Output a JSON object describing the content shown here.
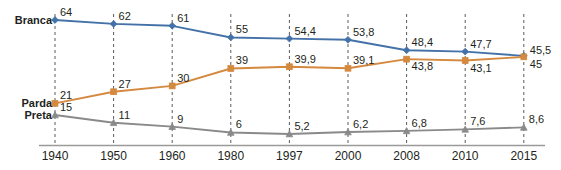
{
  "chart_data": {
    "type": "line",
    "title": "",
    "subtitle": "",
    "xlabel": "",
    "ylabel": "",
    "grid": "vertical-dashed",
    "legend_position": "inline-left",
    "categories": [
      "1940",
      "1950",
      "1960",
      "1980",
      "1997",
      "2000",
      "2008",
      "2010",
      "2015"
    ],
    "xlim": [
      0,
      8
    ],
    "ylim": [
      0,
      70
    ],
    "series": [
      {
        "name": "Branca",
        "color": "#4472a8",
        "marker": "diamond",
        "values": [
          64,
          62,
          61,
          55,
          54.4,
          53.8,
          48.4,
          47.7,
          45.5
        ],
        "labels": [
          "64",
          "62",
          "61",
          "55",
          "54,4",
          "53,8",
          "48,4",
          "47,7",
          "45,5"
        ]
      },
      {
        "name": "Parda",
        "color": "#d4893f",
        "marker": "square",
        "values": [
          21,
          27,
          30,
          39,
          39.9,
          39.1,
          43.8,
          43.1,
          45
        ],
        "labels": [
          "21",
          "27",
          "30",
          "39",
          "39,9",
          "39,1",
          "43,8",
          "43,1",
          "45"
        ]
      },
      {
        "name": "Preta",
        "color": "#8a8a8a",
        "marker": "triangle",
        "values": [
          15,
          11,
          9,
          6,
          5.2,
          6.2,
          6.8,
          7.6,
          8.6
        ],
        "labels": [
          "15",
          "11",
          "9",
          "6",
          "5,2",
          "6,2",
          "6,8",
          "7,6",
          "8,6"
        ]
      }
    ],
    "colors": {
      "branca": "#4472a8",
      "parda": "#d4893f",
      "preta": "#8a8a8a",
      "gridline": "#5a5a5a",
      "axis": "#9a9a9a",
      "text": "#231f20"
    }
  }
}
